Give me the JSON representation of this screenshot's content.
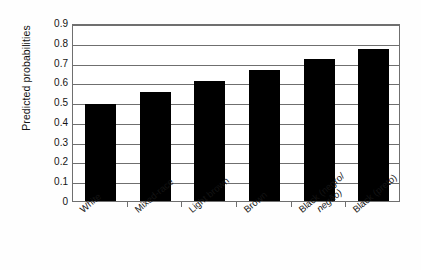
{
  "chart_data": {
    "type": "bar",
    "title": "",
    "subtitle": "",
    "xlabel": "",
    "ylabel": "Predicted probabilities",
    "categories": [
      "White",
      "Mixed-race",
      "Light brown",
      "Brown",
      "Black (negro/",
      "Black (preto)"
    ],
    "category_second_lines": [
      "",
      "",
      "",
      "",
      "negão)",
      ""
    ],
    "values": [
      0.49,
      0.55,
      0.605,
      0.66,
      0.72,
      0.77
    ],
    "ylim": [
      0,
      0.9
    ],
    "y_ticks": [
      0,
      0.1,
      0.2,
      0.3,
      0.4,
      0.5,
      0.6,
      0.7,
      0.8,
      0.9
    ],
    "y_tick_labels": [
      "0",
      "0.1",
      "0.2",
      "0.3",
      "0.4",
      "0.5",
      "0.6",
      "0.7",
      "0.8",
      "0.9"
    ],
    "grid": true,
    "legend": false,
    "legend_position": "none",
    "bar_color": "#000000",
    "plot_background": "#ffffff",
    "axis_color": "#6f6f6f"
  }
}
